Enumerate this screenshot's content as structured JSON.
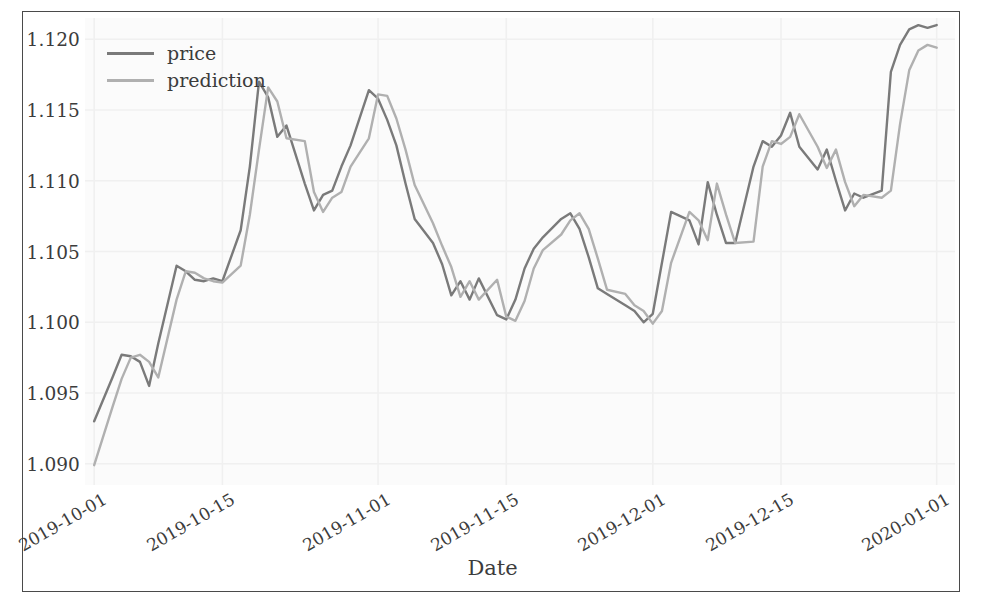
{
  "chart_data": {
    "type": "line",
    "title": "",
    "xlabel": "Date",
    "ylabel": "",
    "grid": true,
    "legend_position": "upper left",
    "xlim": [
      "2019-09-30",
      "2020-01-03"
    ],
    "ylim": [
      1.0885,
      1.1215
    ],
    "yticks": [
      "1.090",
      "1.095",
      "1.100",
      "1.105",
      "1.110",
      "1.115",
      "1.120"
    ],
    "ytick_values": [
      1.09,
      1.095,
      1.1,
      1.105,
      1.11,
      1.115,
      1.12
    ],
    "xticks": [
      "2019-10-01",
      "2019-10-15",
      "2019-11-01",
      "2019-11-15",
      "2019-12-01",
      "2019-12-15",
      "2020-01-01"
    ],
    "xtick_positions": [
      1,
      15,
      32,
      46,
      62,
      76,
      93
    ],
    "x_index_range": [
      0,
      95
    ],
    "series": [
      {
        "name": "price",
        "color": "#7a7a7a",
        "x": [
          1,
          3,
          4,
          5,
          6,
          7,
          8,
          10,
          11,
          12,
          13,
          14,
          15,
          17,
          18,
          19,
          20,
          21,
          22,
          24,
          25,
          26,
          27,
          28,
          29,
          31,
          32,
          33,
          34,
          35,
          36,
          38,
          39,
          40,
          41,
          42,
          43,
          45,
          46,
          47,
          48,
          49,
          50,
          52,
          53,
          54,
          55,
          56,
          57,
          59,
          60,
          61,
          62,
          63,
          64,
          66,
          67,
          68,
          69,
          70,
          71,
          73,
          74,
          75,
          76,
          77,
          78,
          80,
          81,
          82,
          83,
          84,
          85,
          87,
          88,
          89,
          90,
          91,
          92,
          93
        ],
        "values": [
          1.093,
          1.0961,
          1.0977,
          1.0976,
          1.0972,
          1.0955,
          1.0985,
          1.104,
          1.1036,
          1.103,
          1.1029,
          1.1031,
          1.1029,
          1.1065,
          1.111,
          1.117,
          1.1159,
          1.1131,
          1.1139,
          1.1098,
          1.1079,
          1.109,
          1.1093,
          1.111,
          1.1125,
          1.1164,
          1.1158,
          1.1143,
          1.1125,
          1.1098,
          1.1073,
          1.1056,
          1.1041,
          1.1019,
          1.1029,
          1.1016,
          1.1031,
          1.1005,
          1.1002,
          1.1016,
          1.1038,
          1.1052,
          1.106,
          1.1073,
          1.1077,
          1.1066,
          1.1046,
          1.1024,
          1.102,
          1.1012,
          1.1008,
          1.1,
          1.1006,
          1.1042,
          1.1078,
          1.1072,
          1.1055,
          1.1099,
          1.1076,
          1.1056,
          1.1056,
          1.111,
          1.1128,
          1.1124,
          1.1132,
          1.1148,
          1.1124,
          1.1108,
          1.1122,
          1.11,
          1.1079,
          1.1091,
          1.1088,
          1.1093,
          1.1177,
          1.1196,
          1.1207,
          1.121,
          1.1208,
          1.121
        ]
      },
      {
        "name": "prediction",
        "color": "#b0b0b0",
        "x": [
          1,
          3,
          4,
          5,
          6,
          7,
          8,
          10,
          11,
          12,
          13,
          14,
          15,
          17,
          18,
          19,
          20,
          21,
          22,
          24,
          25,
          26,
          27,
          28,
          29,
          31,
          32,
          33,
          34,
          35,
          36,
          38,
          39,
          40,
          41,
          42,
          43,
          45,
          46,
          47,
          48,
          49,
          50,
          52,
          53,
          54,
          55,
          56,
          57,
          59,
          60,
          61,
          62,
          63,
          64,
          66,
          67,
          68,
          69,
          70,
          71,
          73,
          74,
          75,
          76,
          77,
          78,
          80,
          81,
          82,
          83,
          84,
          85,
          87,
          88,
          89,
          90,
          91,
          92,
          93
        ],
        "values": [
          1.0899,
          1.094,
          1.096,
          1.0975,
          1.0977,
          1.0972,
          1.0961,
          1.1016,
          1.1036,
          1.1035,
          1.1031,
          1.1029,
          1.1028,
          1.104,
          1.1076,
          1.1122,
          1.1166,
          1.1156,
          1.113,
          1.1128,
          1.1092,
          1.1078,
          1.1088,
          1.1092,
          1.111,
          1.113,
          1.1161,
          1.116,
          1.1144,
          1.1122,
          1.1097,
          1.107,
          1.1054,
          1.1039,
          1.1018,
          1.1029,
          1.1016,
          1.103,
          1.1004,
          1.1001,
          1.1015,
          1.1038,
          1.1051,
          1.1062,
          1.1072,
          1.1077,
          1.1066,
          1.1045,
          1.1023,
          1.102,
          1.1012,
          1.1008,
          1.0999,
          1.1008,
          1.1042,
          1.1078,
          1.1072,
          1.1058,
          1.1098,
          1.1076,
          1.1056,
          1.1057,
          1.111,
          1.1128,
          1.1126,
          1.1131,
          1.1147,
          1.1124,
          1.1109,
          1.1122,
          1.1099,
          1.1082,
          1.109,
          1.1088,
          1.1093,
          1.114,
          1.1178,
          1.1192,
          1.1196,
          1.1194
        ]
      }
    ]
  },
  "legend": {
    "entries": [
      {
        "label": "price",
        "color": "#7a7a7a"
      },
      {
        "label": "prediction",
        "color": "#b0b0b0"
      }
    ]
  },
  "axes": {
    "xlabel": "Date",
    "yticks": [
      "1.120",
      "1.115",
      "1.110",
      "1.105",
      "1.100",
      "1.095",
      "1.090"
    ],
    "xticks": [
      "2019-10-01",
      "2019-10-15",
      "2019-11-01",
      "2019-11-15",
      "2019-12-01",
      "2019-12-15",
      "2020-01-01"
    ]
  },
  "style": {
    "plot_background": "#fbfbfb",
    "grid_color": "#f0f0f0",
    "frame_color": "#4a4a4a",
    "text_color": "#3c3c3c"
  }
}
